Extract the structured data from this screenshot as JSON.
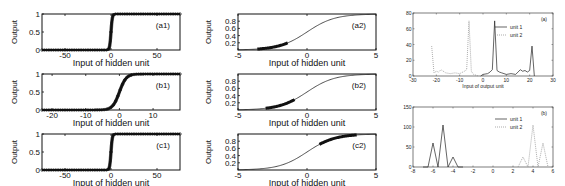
{
  "figure": {
    "panels": {
      "a1": {
        "label": "(a1)",
        "xlabel": "Input of hidden unit",
        "ylabel": "Output",
        "xticks": [
          "-50",
          "0",
          "50"
        ],
        "yticks": [
          "0",
          "0.5",
          "1"
        ]
      },
      "b1": {
        "label": "(b1)",
        "xlabel": "Input of hidden unit",
        "ylabel": "Output",
        "xticks": [
          "-20",
          "-10",
          "0",
          "10"
        ],
        "yticks": [
          "0",
          "0.5",
          "1"
        ]
      },
      "c1": {
        "label": "(c1)",
        "xlabel": "Input of hidden unit",
        "ylabel": "Output",
        "xticks": [
          "-50",
          "0",
          "50"
        ],
        "yticks": [
          "0",
          "0.5",
          "1"
        ]
      },
      "a2": {
        "label": "(a2)",
        "xlabel": "Input of hidden unit",
        "ylabel": "Output",
        "xticks": [
          "-5",
          "0",
          "5"
        ],
        "yticks": [
          "0.2",
          "0.4",
          "0.6",
          "0.8"
        ]
      },
      "b2": {
        "label": "(b2)",
        "xlabel": "Input of hidden unit",
        "ylabel": "Output",
        "xticks": [
          "-5",
          "0",
          "5"
        ],
        "yticks": [
          "0.2",
          "0.4",
          "0.6",
          "0.8"
        ]
      },
      "c2": {
        "label": "(c2)",
        "xlabel": "Input of hidden unit",
        "ylabel": "Output",
        "xticks": [
          "-5",
          "0",
          "5"
        ],
        "yticks": [
          "0.2",
          "0.4",
          "0.6",
          "0.8"
        ]
      },
      "a": {
        "label": "(a)",
        "xlabel": "Input of output unit",
        "xticks": [
          "-30",
          "-20",
          "-10",
          "0",
          "10",
          "20",
          "30"
        ],
        "yticks": [
          "0",
          "20",
          "40",
          "60",
          "80"
        ],
        "legend": [
          "unit 1",
          "unit 2"
        ]
      },
      "b": {
        "label": "(b)",
        "xticks": [
          "-8",
          "-6",
          "-4",
          "-2",
          "0",
          "2",
          "4",
          "6"
        ],
        "yticks": [
          "0",
          "50",
          "100",
          "150"
        ],
        "legend": [
          "unit 1",
          "unit 2"
        ]
      }
    }
  },
  "chart_data": [
    {
      "id": "a1",
      "type": "scatter",
      "title": "(a1)",
      "xlabel": "Input of hidden unit",
      "ylabel": "Output",
      "xlim": [
        -75,
        75
      ],
      "ylim": [
        0,
        1
      ],
      "description": "Steep sigmoid; dense points saturated at 0 for x<0 and at 1 for x>0",
      "x": [
        -70,
        -50,
        -30,
        -10,
        -3,
        -1,
        0,
        1,
        3,
        10,
        30,
        50,
        70
      ],
      "y": [
        0,
        0,
        0,
        0,
        0.05,
        0.27,
        0.5,
        0.73,
        0.95,
        1,
        1,
        1,
        1
      ]
    },
    {
      "id": "b1",
      "type": "scatter",
      "title": "(b1)",
      "xlabel": "Input of hidden unit",
      "ylabel": "Output",
      "xlim": [
        -23,
        18
      ],
      "ylim": [
        0,
        1
      ],
      "description": "Sigmoid with transition between about -3 and 4",
      "x": [
        -22,
        -15,
        -10,
        -5,
        -2,
        0,
        1,
        2,
        4,
        6,
        10,
        17
      ],
      "y": [
        0,
        0,
        0,
        0.01,
        0.12,
        0.4,
        0.6,
        0.78,
        0.96,
        0.99,
        1,
        1
      ]
    },
    {
      "id": "c1",
      "type": "scatter",
      "title": "(c1)",
      "xlabel": "Input of hidden unit",
      "ylabel": "Output",
      "xlim": [
        -75,
        75
      ],
      "ylim": [
        0,
        1
      ],
      "description": "Steep sigmoid; saturated points at 0 and 1",
      "x": [
        -70,
        -50,
        -30,
        -10,
        -3,
        0,
        3,
        10,
        30,
        50,
        70
      ],
      "y": [
        0,
        0,
        0,
        0,
        0.05,
        0.5,
        0.95,
        1,
        1,
        1,
        1
      ]
    },
    {
      "id": "a2",
      "type": "line",
      "title": "(a2)",
      "xlabel": "Input of hidden unit",
      "ylabel": "Output",
      "xlim": [
        -5,
        5
      ],
      "ylim": [
        0,
        1
      ],
      "description": "Logistic curve; data points concentrated between -3.5 and -1.5",
      "x": [
        -5,
        -4,
        -3,
        -2,
        -1,
        0,
        1,
        2,
        3,
        4,
        5
      ],
      "y": [
        0.007,
        0.018,
        0.047,
        0.12,
        0.27,
        0.5,
        0.73,
        0.88,
        0.95,
        0.98,
        0.993
      ]
    },
    {
      "id": "b2",
      "type": "line",
      "title": "(b2)",
      "xlabel": "Input of hidden unit",
      "ylabel": "Output",
      "xlim": [
        -5,
        5
      ],
      "ylim": [
        0,
        1
      ],
      "description": "Logistic curve; data points concentrated between -3 and -1",
      "x": [
        -5,
        -4,
        -3,
        -2,
        -1,
        0,
        1,
        2,
        3,
        4,
        5
      ],
      "y": [
        0.007,
        0.018,
        0.047,
        0.12,
        0.27,
        0.5,
        0.73,
        0.88,
        0.95,
        0.98,
        0.993
      ]
    },
    {
      "id": "c2",
      "type": "line",
      "title": "(c2)",
      "xlabel": "Input of hidden unit",
      "ylabel": "Output",
      "xlim": [
        -5,
        5
      ],
      "ylim": [
        0,
        1
      ],
      "description": "Logistic curve; data points concentrated between 1 and 3.5",
      "x": [
        -5,
        -4,
        -3,
        -2,
        -1,
        0,
        1,
        2,
        3,
        4,
        5
      ],
      "y": [
        0.007,
        0.018,
        0.047,
        0.12,
        0.27,
        0.5,
        0.73,
        0.88,
        0.95,
        0.98,
        0.993
      ]
    },
    {
      "id": "a",
      "type": "line",
      "title": "(a)",
      "xlabel": "Input of output unit",
      "ylabel": "",
      "xlim": [
        -30,
        30
      ],
      "ylim": [
        0,
        80
      ],
      "legend": [
        "unit 1",
        "unit 2"
      ],
      "legend_position": "upper right",
      "series": [
        {
          "name": "unit 1",
          "style": "solid",
          "x": [
            -1,
            0,
            2,
            3,
            4,
            5,
            6,
            7,
            8,
            10,
            12,
            14,
            15,
            16,
            17,
            18,
            19,
            20,
            21,
            22
          ],
          "y": [
            0,
            2,
            3,
            5,
            8,
            70,
            7,
            5,
            4,
            2,
            3,
            2,
            5,
            8,
            6,
            7,
            5,
            7,
            38,
            0
          ]
        },
        {
          "name": "unit 2",
          "style": "dotted",
          "x": [
            -22,
            -21,
            -20,
            -19,
            -18,
            -16,
            -14,
            -12,
            -10,
            -8,
            -7,
            -6,
            -5,
            -4,
            -2
          ],
          "y": [
            38,
            4,
            6,
            5,
            8,
            4,
            3,
            4,
            3,
            6,
            8,
            70,
            6,
            2,
            0
          ]
        }
      ]
    },
    {
      "id": "b",
      "type": "line",
      "title": "(b)",
      "xlabel": "",
      "ylabel": "",
      "xlim": [
        -8,
        6
      ],
      "ylim": [
        0,
        150
      ],
      "legend": [
        "unit 1",
        "unit 2"
      ],
      "legend_position": "upper right",
      "series": [
        {
          "name": "unit 1",
          "style": "solid",
          "x": [
            -7,
            -6.5,
            -6,
            -5.5,
            -5,
            -4.5,
            -4,
            -3.5,
            -3
          ],
          "y": [
            0,
            0,
            60,
            0,
            105,
            0,
            25,
            0,
            0
          ]
        },
        {
          "name": "unit 2",
          "style": "dotted",
          "x": [
            2.5,
            3,
            3.5,
            4,
            4.5,
            5,
            5.5
          ],
          "y": [
            0,
            25,
            0,
            105,
            0,
            60,
            0
          ]
        }
      ]
    }
  ]
}
